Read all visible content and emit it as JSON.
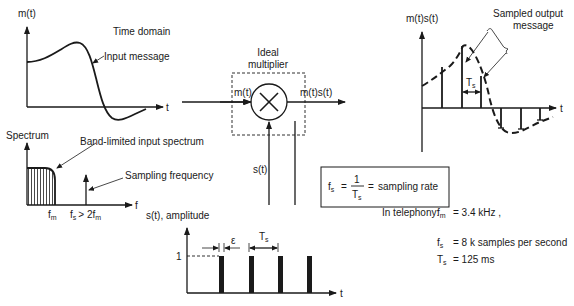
{
  "time_domain": {
    "y_label": "m(t)",
    "title": "Time domain",
    "curve_label": "Input message",
    "x_label": "t"
  },
  "spectrum": {
    "y_label": "Spectrum",
    "band_label": "Band-limited input spectrum",
    "sampling_label": "Sampling frequency",
    "x_label": "f",
    "fm_main": "f",
    "fm_sub": "m",
    "fs_main": "f",
    "fs_sub": "s",
    "fs_condition": "> 2f",
    "fs_condition_sub": "m"
  },
  "multiplier": {
    "title_line1": "Ideal",
    "title_line2": "multiplier",
    "input_label": "m(t)",
    "output_label": "m(t)s(t)",
    "sampling_input_label": "s(t)",
    "symbol": "×"
  },
  "formula_box": {
    "lhs_main": "f",
    "lhs_sub": "s",
    "equals1": "=",
    "numerator": "1",
    "denominator_main": "T",
    "denominator_sub": "s",
    "equals2": "=",
    "rhs": "sampling rate"
  },
  "sampled_output": {
    "y_label": "m(t)s(t)",
    "title_line1": "Sampled output",
    "title_line2": "message",
    "period_main": "T",
    "period_sub": "s",
    "x_label": "t"
  },
  "pulse_train": {
    "y_label": "s(t), amplitude",
    "amplitude_tick": "1",
    "width_label": "ε",
    "period_main": "T",
    "period_sub": "s",
    "x_label": "t"
  },
  "telephony": {
    "intro": "In telephony:",
    "rows": [
      {
        "main": "f",
        "sub": "m",
        "value": "= 3.4 kHz ,"
      },
      {
        "main": "f",
        "sub": "s",
        "value": "= 8 k samples per second"
      },
      {
        "main": "T",
        "sub": "s",
        "value": "= 125 ms"
      }
    ]
  }
}
